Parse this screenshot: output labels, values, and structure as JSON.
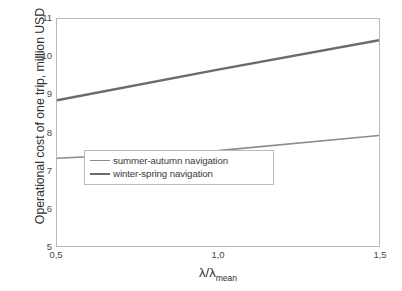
{
  "chart_data": {
    "type": "line",
    "title": "",
    "subtitle": "",
    "xlabel": "λ/λ",
    "xlabel_sub": "mean",
    "ylabel": "Operational cost  of one trip, million USD",
    "xlim": [
      0.5,
      1.5
    ],
    "ylim": [
      5,
      11
    ],
    "x_tick_labels": [
      "0,5",
      "1,0",
      "1,5"
    ],
    "x_tick_values": [
      0.5,
      1.0,
      1.5
    ],
    "y_tick_labels": [
      "5",
      "6",
      "7",
      "8",
      "9",
      "10",
      "11"
    ],
    "y_tick_values": [
      5,
      6,
      7,
      8,
      9,
      10,
      11
    ],
    "grid": false,
    "legend_position": "inside-center",
    "x": [
      0.5,
      1.0,
      1.5
    ],
    "series": [
      {
        "name": "summer-autumn navigation",
        "values": [
          7.32,
          7.52,
          7.92
        ],
        "color": "#8c8c8c",
        "width": 1.6
      },
      {
        "name": "winter-spring navigation",
        "values": [
          8.85,
          9.66,
          10.44
        ],
        "color": "#6b6b6b",
        "width": 2.4
      }
    ]
  },
  "axes": {
    "frame_color": "#b9b9b9",
    "tick_color": "#4a4a4a"
  },
  "legend": {
    "items": [
      {
        "label": "summer-autumn navigation"
      },
      {
        "label": "winter-spring navigation"
      }
    ]
  }
}
